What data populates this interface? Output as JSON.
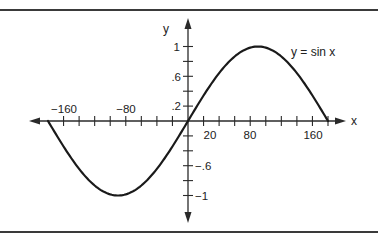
{
  "chart_data": {
    "type": "line",
    "title": "",
    "annotation": "y = sin x",
    "xlabel": "x",
    "ylabel": "y",
    "xlim": [
      -180,
      180
    ],
    "ylim": [
      -1,
      1
    ],
    "grid": false,
    "x_ticks_step": 20,
    "y_ticks_step": 0.2,
    "x_tick_labels": [
      "-160",
      "-80",
      "20",
      "80",
      "160"
    ],
    "x_tick_label_values": [
      -160,
      -80,
      20,
      80,
      160
    ],
    "y_tick_labels": [
      "1",
      ".6",
      ".2",
      "-.6",
      "-1"
    ],
    "y_tick_label_values": [
      1,
      0.6,
      0.2,
      -0.6,
      -1
    ],
    "series": [
      {
        "name": "y = sin x",
        "x": [
          -180,
          -160,
          -140,
          -120,
          -100,
          -90,
          -80,
          -60,
          -40,
          -20,
          0,
          20,
          40,
          60,
          80,
          90,
          100,
          120,
          140,
          160,
          180
        ],
        "values": [
          0,
          -0.342,
          -0.643,
          -0.866,
          -0.985,
          -1,
          -0.985,
          -0.866,
          -0.643,
          -0.342,
          0,
          0.342,
          0.643,
          0.866,
          0.985,
          1,
          0.985,
          0.866,
          0.643,
          0.342,
          0
        ]
      }
    ]
  },
  "labels": {
    "y_axis": "y",
    "x_axis": "x",
    "curve": "y = sin x",
    "xt_m160": "−160",
    "xt_m80": "−80",
    "xt_20": "20",
    "xt_80": "80",
    "xt_160": "160",
    "yt_1": "1",
    "yt_06": ".6",
    "yt_02": ".2",
    "yt_m06": "−.6",
    "yt_m1": "−1"
  },
  "colors": {
    "line": "#1a1a1a",
    "axis": "#2a2a2a",
    "rule": "#3a3a3a",
    "background": "#ffffff"
  }
}
